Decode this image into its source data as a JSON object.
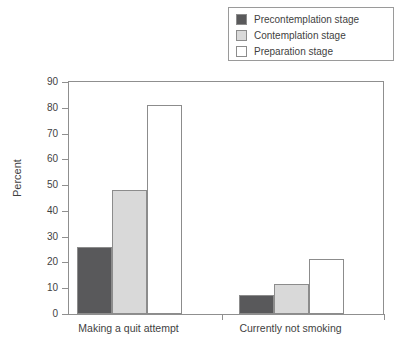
{
  "chart_data": {
    "type": "bar",
    "title": "",
    "xlabel": "",
    "ylabel": "Percent",
    "ylim": [
      0,
      90
    ],
    "yticks": [
      0,
      10,
      20,
      30,
      40,
      50,
      60,
      70,
      80,
      90
    ],
    "grid": false,
    "legend_position": "top-right",
    "categories": [
      "Making a quit attempt",
      "Currently not smoking"
    ],
    "series": [
      {
        "name": "Precontemplation stage",
        "color": "#59595b",
        "values": [
          26,
          7.5
        ]
      },
      {
        "name": "Contemplation stage",
        "color": "#d9d9d9",
        "values": [
          48,
          11.5
        ]
      },
      {
        "name": "Preparation stage",
        "color": "#ffffff",
        "values": [
          81,
          21.5
        ]
      }
    ]
  },
  "legend": {
    "items": [
      {
        "label": "Precontemplation stage",
        "color": "#59595b"
      },
      {
        "label": "Contemplation stage",
        "color": "#d9d9d9"
      },
      {
        "label": "Preparation stage",
        "color": "#ffffff"
      }
    ]
  },
  "axes": {
    "y_title": "Percent",
    "y_ticks": [
      "0",
      "10",
      "20",
      "30",
      "40",
      "50",
      "60",
      "70",
      "80",
      "90"
    ],
    "x_categories": [
      "Making a quit attempt",
      "Currently not smoking"
    ]
  }
}
